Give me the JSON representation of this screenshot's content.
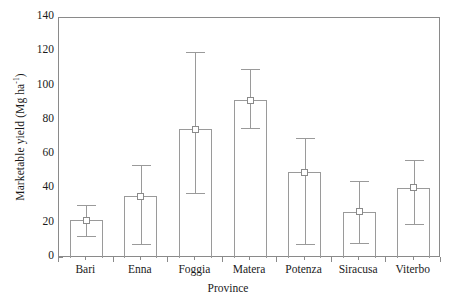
{
  "chart_data": {
    "type": "bar",
    "title": "",
    "xlabel": "Province",
    "ylabel": "Marketable yield (Mg ha",
    "ylabel_sup": "-1",
    "ylabel_tail": ")",
    "ylabel_full": "Marketable yield (Mg ha-1)",
    "categories": [
      "Bari",
      "Enna",
      "Foggia",
      "Matera",
      "Potenza",
      "Siracusa",
      "Viterbo"
    ],
    "values": [
      22,
      36,
      75,
      92,
      50,
      27,
      41
    ],
    "err_upper": [
      31,
      54,
      120,
      110,
      70,
      45,
      57
    ],
    "err_lower": [
      13,
      8,
      38,
      76,
      8,
      9,
      20
    ],
    "ylim": [
      0,
      140
    ],
    "ytick_labels": [
      "0",
      "20",
      "40",
      "60",
      "80",
      "100",
      "120",
      "140"
    ],
    "ytick_values": [
      0,
      20,
      40,
      60,
      80,
      100,
      120,
      140
    ],
    "yminor_values": [
      10,
      30,
      50,
      70,
      90,
      110,
      130
    ],
    "grid": false,
    "legend": "none",
    "marker": "open-square",
    "bar_fill": "#ffffff",
    "bar_edge": "#9a9a9a",
    "axis_color": "#8a8a8a",
    "text_color": "#1a1a1a"
  }
}
